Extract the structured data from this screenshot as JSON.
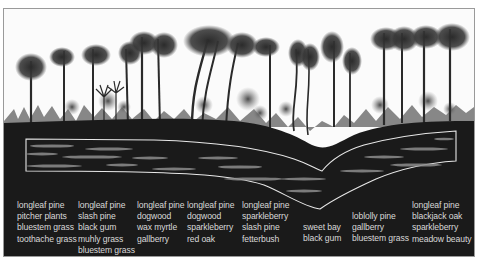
{
  "figure": {
    "title": "",
    "colors": {
      "background": "#fbfbfb",
      "soil": "#1a1a1a",
      "strata_outline": "#e8e8e8",
      "label_text": "#d9d9d9",
      "tree": "#2a2a2a"
    }
  },
  "communities": [
    {
      "species": [
        "longleaf pine",
        "pitcher plants",
        "bluestem grass",
        "toothache grass"
      ]
    },
    {
      "species": [
        "longleaf pine",
        "slash pine",
        "black gum",
        "muhly grass",
        "bluestem grass"
      ]
    },
    {
      "species": [
        "longleaf pine",
        "dogwood",
        "wax myrtle",
        "gallberry"
      ]
    },
    {
      "species": [
        "longleaf pine",
        "dogwood",
        "sparkleberry",
        "red oak"
      ]
    },
    {
      "species": [
        "longleaf pine",
        "sparkleberry",
        "slash pine",
        "fetterbush"
      ]
    },
    {
      "species": [
        "sweet bay",
        "black gum"
      ]
    },
    {
      "species": [
        "loblolly pine",
        "gallberry",
        "bluestem grass"
      ]
    },
    {
      "species": [
        "longleaf pine",
        "blackjack oak",
        "sparkleberry",
        "meadow beauty"
      ]
    }
  ]
}
